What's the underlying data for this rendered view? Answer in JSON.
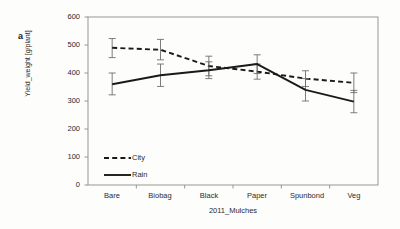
{
  "figure": {
    "panel_label": "a",
    "background": "#fdfdfc",
    "line_color": "#1a1a1a",
    "axis_color": "#8c8c8c"
  },
  "chart_data": {
    "type": "line",
    "title": "",
    "xlabel": "2011_Mulches",
    "ylabel": "Yield_weight [g/plant]",
    "categories": [
      "Bare",
      "Biobag",
      "Black",
      "Paper",
      "Spunbond",
      "Veg"
    ],
    "ylim": [
      0,
      600
    ],
    "yticks": [
      0,
      100,
      200,
      300,
      400,
      500,
      600
    ],
    "ytick_labels": [
      "0",
      "100",
      "200",
      "300",
      "400",
      "500",
      "600"
    ],
    "grid": false,
    "legend_position": "inside-lower-left",
    "series": [
      {
        "name": "City",
        "style": "dashed",
        "values": [
          490,
          483,
          425,
          405,
          380,
          365
        ],
        "error_upper": [
          523,
          520,
          460,
          432,
          408,
          400
        ],
        "error_lower": [
          455,
          447,
          390,
          378,
          352,
          330
        ]
      },
      {
        "name": "Rain",
        "style": "solid",
        "values": [
          360,
          392,
          410,
          432,
          340,
          298
        ],
        "error_upper": [
          400,
          432,
          440,
          465,
          380,
          338
        ],
        "error_lower": [
          322,
          352,
          380,
          398,
          300,
          258
        ]
      }
    ]
  }
}
